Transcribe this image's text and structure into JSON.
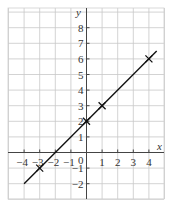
{
  "chart_data": {
    "type": "line",
    "title": "",
    "xlabel": "x",
    "ylabel": "y",
    "xlim": [
      -5,
      5
    ],
    "ylim": [
      -3,
      9
    ],
    "grid": true,
    "x_ticks": [
      "−4",
      "−3",
      "−2",
      "−1",
      "1",
      "2",
      "3",
      "4"
    ],
    "y_ticks": [
      "8",
      "7",
      "6",
      "5",
      "4",
      "3",
      "2",
      "1",
      "−1",
      "−2"
    ],
    "origin_label": "0",
    "line": {
      "equation": "y = x + 2",
      "x_range": [
        -4,
        4.5
      ]
    },
    "marked_points": [
      {
        "x": -3,
        "y": -1
      },
      {
        "x": 0,
        "y": 2
      },
      {
        "x": 1,
        "y": 3
      },
      {
        "x": 4,
        "y": 6
      }
    ]
  }
}
